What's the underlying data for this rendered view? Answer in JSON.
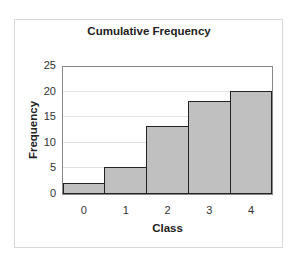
{
  "chart_data": {
    "type": "bar",
    "title": "Cumulative Frequency",
    "xlabel": "Class",
    "ylabel": "Frequency",
    "categories": [
      "0",
      "1",
      "2",
      "3",
      "4"
    ],
    "values": [
      2,
      5,
      13,
      18,
      20
    ],
    "ylim": [
      0,
      25
    ],
    "yticks": [
      "0",
      "5",
      "10",
      "15",
      "20",
      "25"
    ],
    "grid": true,
    "legend": null,
    "bar_color": "#c0c0c0",
    "bar_edge_color": "#222222"
  }
}
